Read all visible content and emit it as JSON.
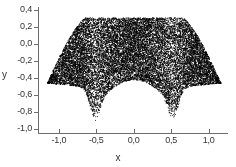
{
  "chart_data": {
    "type": "scatter",
    "title": "",
    "subtitle": "",
    "xlabel": "x",
    "ylabel": "y",
    "xlim": [
      -1.28,
      1.26
    ],
    "ylim": [
      -1.05,
      0.42
    ],
    "xticks": [
      -1.0,
      -0.5,
      0.0,
      0.5,
      1.0
    ],
    "yticks": [
      0.4,
      0.2,
      0.0,
      -0.2,
      -0.4,
      -0.6,
      -0.8,
      -1.0
    ],
    "xticklabels": [
      "-1,0",
      "-0,5",
      "0,0",
      "0,5",
      "1,0"
    ],
    "yticklabels": [
      "0,4",
      "0,2",
      "0,0",
      "-0,2",
      "-0,4",
      "-0,6",
      "-0,8",
      "-1,0"
    ],
    "decimal_separator": ",",
    "grid": false,
    "legend": null,
    "marker": {
      "style": "point",
      "size_px": 0.9,
      "color": "#000000"
    },
    "point_count": 16000,
    "series": [
      {
        "name": "samples",
        "color": "#000000",
        "description": "Dense uniformly filled region bounded by a hexagonal-arch envelope: flat top edge near y=0.31, sloped upper shoulders down to side wing tips near (-1.16,-0.46) and (1.16,-0.46), a raised central arch of the lower boundary peaking near (0.0,-0.42), and two narrow downward spikes near x=-0.52 and x=0.52 reaching y=-0.90.",
        "boundary": {
          "top_y": 0.31,
          "top_x_range": [
            -0.64,
            0.66
          ],
          "upper_shoulder_left": [
            [
              -0.64,
              0.31
            ],
            [
              -0.8,
              0.22
            ],
            [
              -1.16,
              -0.46
            ]
          ],
          "upper_shoulder_right": [
            [
              0.66,
              0.31
            ],
            [
              0.82,
              0.22
            ],
            [
              1.16,
              -0.46
            ]
          ],
          "wing_tip_left": [
            -1.16,
            -0.46
          ],
          "wing_tip_right": [
            1.16,
            -0.46
          ],
          "lower_left_edge": [
            [
              -1.16,
              -0.46
            ],
            [
              -0.78,
              -0.52
            ],
            [
              -0.62,
              -0.62
            ]
          ],
          "spike_left_x": -0.52,
          "spike_left_bottom_y": -0.9,
          "spike_right_x": 0.52,
          "spike_right_bottom_y": -0.9,
          "central_arch_peak": [
            0.0,
            -0.42
          ],
          "central_arch_left_base": [
            -0.4,
            -0.62
          ],
          "central_arch_right_base": [
            0.4,
            -0.62
          ]
        }
      }
    ]
  },
  "axes": {
    "x_title": "x",
    "y_title": "y",
    "x_tick_labels": [
      "-1,0",
      "-0,5",
      "0,0",
      "0,5",
      "1,0"
    ],
    "y_tick_labels": [
      "0,4",
      "0,2",
      "0,0",
      "-0,2",
      "-0,4",
      "-0,6",
      "-0,8",
      "-1,0"
    ]
  },
  "colors": {
    "point": "#000000",
    "axis": "#6d6d6d",
    "text": "#333333",
    "background": "#ffffff"
  }
}
